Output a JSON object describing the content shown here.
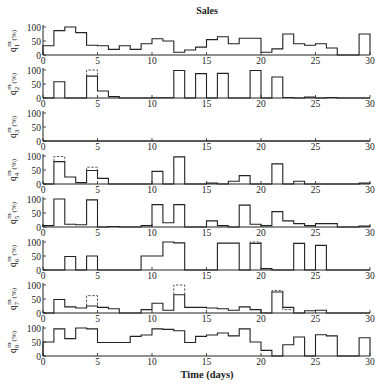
{
  "chart_data": {
    "type": "line",
    "subtype": "step",
    "title": "Sales",
    "xlabel": "Time (days)",
    "xlim": [
      0,
      30
    ],
    "xticks": [
      0,
      5,
      10,
      15,
      20,
      25,
      30
    ],
    "ylim": [
      0,
      100
    ],
    "yticks": [
      0,
      50,
      100
    ],
    "grid": false,
    "legend": null,
    "panels": [
      {
        "ylabel_main": "q",
        "ylabel_sub": "1",
        "ylabel_sup": "m",
        "ylabel_unit": "(%)",
        "values": [
          33,
          87,
          100,
          80,
          35,
          33,
          20,
          33,
          20,
          40,
          58,
          50,
          10,
          18,
          28,
          55,
          65,
          40,
          60,
          60,
          10,
          22,
          75,
          40,
          35,
          40,
          25,
          0,
          0,
          75
        ],
        "dashed": []
      },
      {
        "ylabel_main": "q",
        "ylabel_sub": "2",
        "ylabel_sup": "m",
        "ylabel_unit": "(%)",
        "values": [
          0,
          58,
          0,
          0,
          78,
          25,
          5,
          0,
          0,
          0,
          1,
          1,
          98,
          0,
          87,
          0,
          88,
          0,
          0,
          98,
          0,
          75,
          2,
          0,
          3,
          0,
          2,
          0,
          0,
          0
        ],
        "dashed": [
          {
            "x0": 4,
            "x1": 5,
            "value": 100
          }
        ]
      },
      {
        "ylabel_main": "q",
        "ylabel_sub": "3",
        "ylabel_sup": "m",
        "ylabel_unit": "(%)",
        "values": [
          0,
          0,
          0,
          0,
          0,
          0,
          0,
          0,
          0,
          0,
          0,
          0,
          0,
          0,
          0,
          0,
          0,
          0,
          0,
          0,
          0,
          0,
          0,
          0,
          0,
          0,
          0,
          0,
          0,
          0
        ],
        "dashed": []
      },
      {
        "ylabel_main": "q",
        "ylabel_sub": "4",
        "ylabel_sup": "m",
        "ylabel_unit": "(%)",
        "values": [
          0,
          80,
          25,
          5,
          48,
          20,
          0,
          0,
          0,
          0,
          45,
          0,
          97,
          0,
          0,
          3,
          0,
          10,
          30,
          0,
          0,
          72,
          0,
          10,
          0,
          0,
          0,
          0,
          0,
          3
        ],
        "dashed": [
          {
            "x0": 1,
            "x1": 2,
            "value": 98
          },
          {
            "x0": 4,
            "x1": 5,
            "value": 60
          }
        ]
      },
      {
        "ylabel_main": "q",
        "ylabel_sub": "5",
        "ylabel_sup": "m",
        "ylabel_unit": "(%)",
        "values": [
          5,
          100,
          10,
          8,
          97,
          0,
          2,
          0,
          0,
          5,
          80,
          15,
          80,
          0,
          0,
          22,
          5,
          0,
          78,
          10,
          5,
          55,
          22,
          12,
          5,
          12,
          12,
          0,
          0,
          3
        ],
        "dashed": []
      },
      {
        "ylabel_main": "q",
        "ylabel_sub": "6",
        "ylabel_sup": "m",
        "ylabel_unit": "(%)",
        "values": [
          0,
          0,
          48,
          0,
          50,
          0,
          0,
          0,
          0,
          50,
          50,
          100,
          97,
          0,
          0,
          0,
          96,
          96,
          0,
          95,
          5,
          0,
          0,
          95,
          0,
          88,
          0,
          0,
          0,
          0
        ],
        "dashed": [
          {
            "x0": 19,
            "x1": 20,
            "value": 100
          }
        ]
      },
      {
        "ylabel_main": "q",
        "ylabel_sub": "7",
        "ylabel_sup": "m",
        "ylabel_unit": "(%)",
        "values": [
          0,
          48,
          22,
          18,
          25,
          20,
          15,
          0,
          0,
          12,
          35,
          10,
          65,
          20,
          20,
          18,
          15,
          10,
          22,
          12,
          0,
          75,
          20,
          0,
          8,
          10,
          0,
          0,
          0,
          0
        ],
        "dashed": [
          {
            "x0": 4,
            "x1": 5,
            "value": 62
          },
          {
            "x0": 12,
            "x1": 13,
            "value": 100
          },
          {
            "x0": 21,
            "x1": 22,
            "value": 80
          },
          {
            "x0": 22,
            "x1": 23,
            "value": 12
          }
        ]
      },
      {
        "ylabel_main": "q",
        "ylabel_sub": "8",
        "ylabel_sup": "m",
        "ylabel_unit": "(%)",
        "values": [
          50,
          97,
          62,
          100,
          97,
          48,
          48,
          48,
          70,
          75,
          97,
          95,
          90,
          48,
          70,
          75,
          82,
          72,
          97,
          50,
          20,
          0,
          40,
          68,
          0,
          76,
          72,
          0,
          0,
          65
        ],
        "dashed": []
      }
    ]
  }
}
